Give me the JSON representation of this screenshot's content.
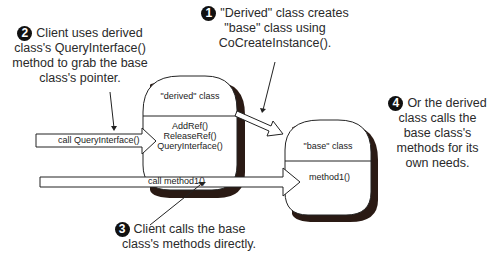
{
  "diagram": {
    "notes": [
      {
        "number": "1",
        "text_lines": [
          "\"Derived\" class creates",
          "\"base\" class using",
          "CoCreateInstance()."
        ]
      },
      {
        "number": "2",
        "text_lines": [
          "Client uses derived",
          "class's QueryInterface()",
          "method to grab the base",
          "class's pointer."
        ]
      },
      {
        "number": "3",
        "text_lines": [
          "Client calls the base",
          "class's methods directly."
        ]
      },
      {
        "number": "4",
        "text_lines": [
          "Or the derived",
          "class calls the",
          "base class's",
          "methods for its",
          "own needs."
        ]
      }
    ],
    "derived_class": {
      "title": "\"derived\" class",
      "methods": [
        "AddRef()",
        "ReleaseRef()",
        "QueryInterface()"
      ]
    },
    "base_class": {
      "title": "\"base\" class",
      "methods": [
        "method1()"
      ]
    },
    "arrows": {
      "query_interface_label": "call QueryInterface()",
      "method1_label": "call method1()"
    },
    "colors": {
      "line": "#222222",
      "shadow": "#2a1a14",
      "background": "#ffffff"
    }
  }
}
